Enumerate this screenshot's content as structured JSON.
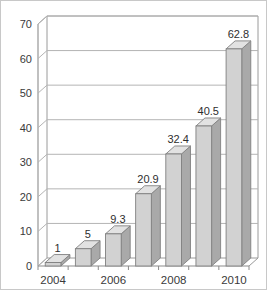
{
  "chart_data": {
    "type": "bar",
    "title": "",
    "subtitle": "",
    "xlabel": "",
    "ylabel": "",
    "categories": [
      "2004",
      "2005",
      "2006",
      "2007",
      "2008",
      "2009",
      "2010"
    ],
    "values": [
      1,
      5,
      9.3,
      20.9,
      32.4,
      40.5,
      62.8
    ],
    "data_labels": [
      "1",
      "5",
      "9.3",
      "20.9",
      "32.4",
      "40.5",
      "62.8"
    ],
    "x_tick_labels": [
      "2004",
      "",
      "2006",
      "",
      "2008",
      "",
      "2010"
    ],
    "y_tick_labels": [
      "0",
      "10",
      "20",
      "30",
      "40",
      "50",
      "60",
      "70"
    ],
    "y_ticks": [
      0,
      10,
      20,
      30,
      40,
      50,
      60,
      70
    ],
    "ylim": [
      0,
      70
    ],
    "grid": true,
    "grid_axis": "y",
    "legend": false,
    "legend_position": "none",
    "style": "3d-columns",
    "colors": {
      "bar_front": "#d2d2d2",
      "bar_side": "#a9a9a9",
      "bar_top": "#e2e2e2",
      "bar_outline": "#808080",
      "gridline": "#b4b4b4",
      "axis": "#8c8c8c",
      "text": "#3a3a3a",
      "background": "#ffffff",
      "border": "#c8c8c8"
    }
  }
}
